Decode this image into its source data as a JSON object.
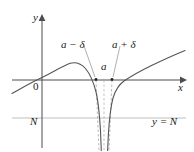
{
  "figure": {
    "background_color": "#ffffff",
    "axis_color": "#4d4d4d",
    "curve_color": "#555555",
    "dashed_color": "#9a9a9a",
    "level_line_color": "#b0b0b0",
    "text_color": "#1a1a1a"
  },
  "axes": {
    "y_axis_label": "y",
    "x_axis_label": "x",
    "origin_label": "0",
    "x_axis_y": 80,
    "y_axis_x": 42,
    "x_axis_range": [
      12,
      186
    ],
    "y_axis_range": [
      16,
      148
    ]
  },
  "annotations": {
    "a_minus_delta": "a − δ",
    "a_plus_delta": "a + δ",
    "a": "a",
    "N": "N",
    "y_equals_N": "y = N"
  },
  "chart_data": {
    "type": "line",
    "title": "",
    "xlabel": "x",
    "ylabel": "y",
    "grid": false,
    "legend": "none",
    "asymptote_x_px": 104,
    "level_line_y_px": 118,
    "delta_interval_px": [
      96,
      112
    ],
    "marked_points_px": [
      [
        96,
        80
      ],
      [
        112,
        80
      ]
    ],
    "curve_points_px": [
      [
        12,
        93
      ],
      [
        20,
        88
      ],
      [
        26,
        85
      ],
      [
        34,
        81
      ],
      [
        42,
        77
      ],
      [
        52,
        71
      ],
      [
        60,
        67
      ],
      [
        68,
        64
      ],
      [
        74,
        63
      ],
      [
        80,
        64
      ],
      [
        84,
        67
      ],
      [
        88,
        72
      ],
      [
        91,
        79
      ],
      [
        94,
        89
      ],
      [
        96,
        100
      ],
      [
        98,
        116
      ],
      [
        99,
        130
      ],
      [
        100,
        145
      ],
      [
        101,
        151
      ]
    ],
    "curve_points_right_px": [
      [
        108,
        151
      ],
      [
        109,
        138
      ],
      [
        110,
        124
      ],
      [
        112,
        108
      ],
      [
        114,
        97
      ],
      [
        117,
        89
      ],
      [
        121,
        84
      ],
      [
        126,
        80
      ],
      [
        132,
        76
      ],
      [
        140,
        71
      ],
      [
        150,
        66
      ],
      [
        162,
        60
      ],
      [
        174,
        55
      ],
      [
        184,
        51
      ]
    ],
    "leader_lines_px": [
      {
        "from": [
          84,
          46
        ],
        "to": [
          95,
          77
        ]
      },
      {
        "from": [
          120,
          46
        ],
        "to": [
          113,
          77
        ]
      }
    ]
  }
}
